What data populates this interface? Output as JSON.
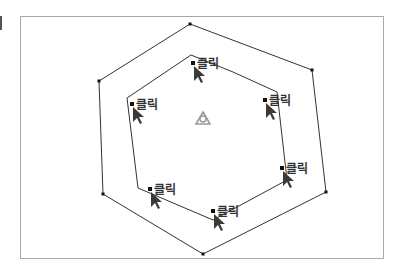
{
  "diagram": {
    "frame": {
      "x": 20,
      "y": 16,
      "w": 364,
      "h": 243,
      "color": "#a9a9a9"
    },
    "outer_polygon": {
      "color": "#333333",
      "vertices": [
        [
          190,
          24
        ],
        [
          312,
          70
        ],
        [
          326,
          192
        ],
        [
          203,
          254
        ],
        [
          103,
          194
        ],
        [
          99,
          81
        ]
      ]
    },
    "inner_polygon": {
      "color": "#333333",
      "vertices": [
        [
          191,
          55
        ],
        [
          233,
          72
        ],
        [
          277,
          92
        ],
        [
          287,
          180
        ],
        [
          213,
          220
        ],
        [
          138,
          188
        ],
        [
          127,
          98
        ]
      ]
    },
    "click_points": [
      {
        "x": 193,
        "y": 63,
        "label": "클릭"
      },
      {
        "x": 265,
        "y": 100,
        "label": "클릭"
      },
      {
        "x": 282,
        "y": 168,
        "label": "클릭"
      },
      {
        "x": 213,
        "y": 211,
        "label": "클릭"
      },
      {
        "x": 150,
        "y": 189,
        "label": "클릭"
      },
      {
        "x": 132,
        "y": 104,
        "label": "클릭"
      }
    ],
    "center_icon": {
      "name": "recycle-triangle-icon",
      "x": 203,
      "y": 119,
      "color": "#9a9a9a"
    }
  }
}
